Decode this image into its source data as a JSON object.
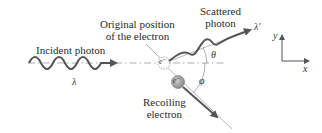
{
  "diagram": {
    "labels": {
      "incident_photon": "Incident photon",
      "original_position_line1": "Original position",
      "original_position_line2": "of the electron",
      "scattered_line1": "Scattered",
      "scattered_line2": "photon",
      "recoiling_line1": "Recoiling",
      "recoiling_line2": "electron"
    },
    "symbols": {
      "lambda": "λ",
      "lambda_prime": "λ′",
      "theta": "θ",
      "phi": "φ",
      "electron": "e⁻",
      "axis_x": "x",
      "axis_y": "y"
    },
    "colors": {
      "wave": "#555555",
      "line": "#888888",
      "recoil_electron_fill": "#9a9a9a",
      "text": "#2a2a2a"
    }
  }
}
